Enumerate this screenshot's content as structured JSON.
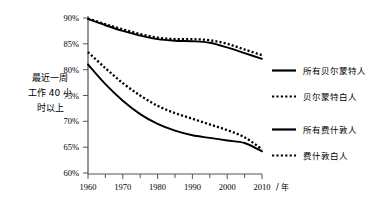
{
  "chart_data": {
    "type": "line",
    "title": "",
    "subtitle": "",
    "xlabel": "/ 年",
    "ylabel": "最近一周工作 40 小时以上",
    "ylabel_lines": [
      "最近一周",
      "工作 40 小",
      "时以上"
    ],
    "xlim": [
      1960,
      2010
    ],
    "ylim": [
      60,
      90
    ],
    "grid": false,
    "legend_position": "right",
    "x_tick_labels": [
      "1960",
      "1970",
      "1980",
      "1990",
      "2000",
      "2010"
    ],
    "x_tick_values": [
      1960,
      1970,
      1980,
      1990,
      2000,
      2010
    ],
    "x_minor_ticks": [
      1965,
      1975,
      1985,
      1995,
      2005
    ],
    "y_tick_labels": [
      "90%",
      "85%",
      "80%",
      "75%",
      "70%",
      "65%",
      "60%"
    ],
    "y_tick_values": [
      90,
      85,
      80,
      75,
      70,
      65,
      60
    ],
    "x": [
      1960,
      1965,
      1970,
      1975,
      1980,
      1985,
      1990,
      1995,
      2000,
      2005,
      2010
    ],
    "series": [
      {
        "name": "所有贝尔蒙特人",
        "style": "solid",
        "color": "#000000",
        "values": [
          89.8,
          88.6,
          87.5,
          86.6,
          85.9,
          85.6,
          85.5,
          85.2,
          84.3,
          83.2,
          82.1
        ]
      },
      {
        "name": "贝尔蒙特白人",
        "style": "dotted",
        "color": "#000000",
        "values": [
          89.9,
          88.8,
          87.8,
          86.9,
          86.2,
          85.9,
          85.9,
          85.7,
          85.0,
          83.9,
          82.8
        ]
      },
      {
        "name": "所有费什敦人",
        "style": "solid",
        "color": "#000000",
        "values": [
          81.0,
          77.2,
          74.0,
          71.4,
          69.5,
          68.2,
          67.3,
          66.8,
          66.3,
          65.8,
          64.2
        ]
      },
      {
        "name": "费什敦白人",
        "style": "dotted",
        "color": "#000000",
        "values": [
          83.4,
          80.3,
          77.4,
          75.0,
          73.0,
          71.6,
          70.5,
          69.4,
          68.3,
          66.9,
          64.6
        ]
      }
    ]
  },
  "legend": {
    "items": [
      {
        "label": "所有贝尔蒙特人",
        "style": "solid"
      },
      {
        "label": "贝尔蒙特白人",
        "style": "dotted"
      },
      {
        "label": "所有费什敦人",
        "style": "solid"
      },
      {
        "label": "费什敦白人",
        "style": "dotted"
      }
    ]
  },
  "axis": {
    "x_unit": "/ 年",
    "y_caption_line1": "最近一周",
    "y_caption_line2": "工作 40 小",
    "y_caption_line3": "时以上"
  },
  "ticks": {
    "y": [
      "90%",
      "85%",
      "80%",
      "75%",
      "70%",
      "65%",
      "60%"
    ],
    "x": [
      "1960",
      "1970",
      "1980",
      "1990",
      "2000",
      "2010"
    ]
  }
}
